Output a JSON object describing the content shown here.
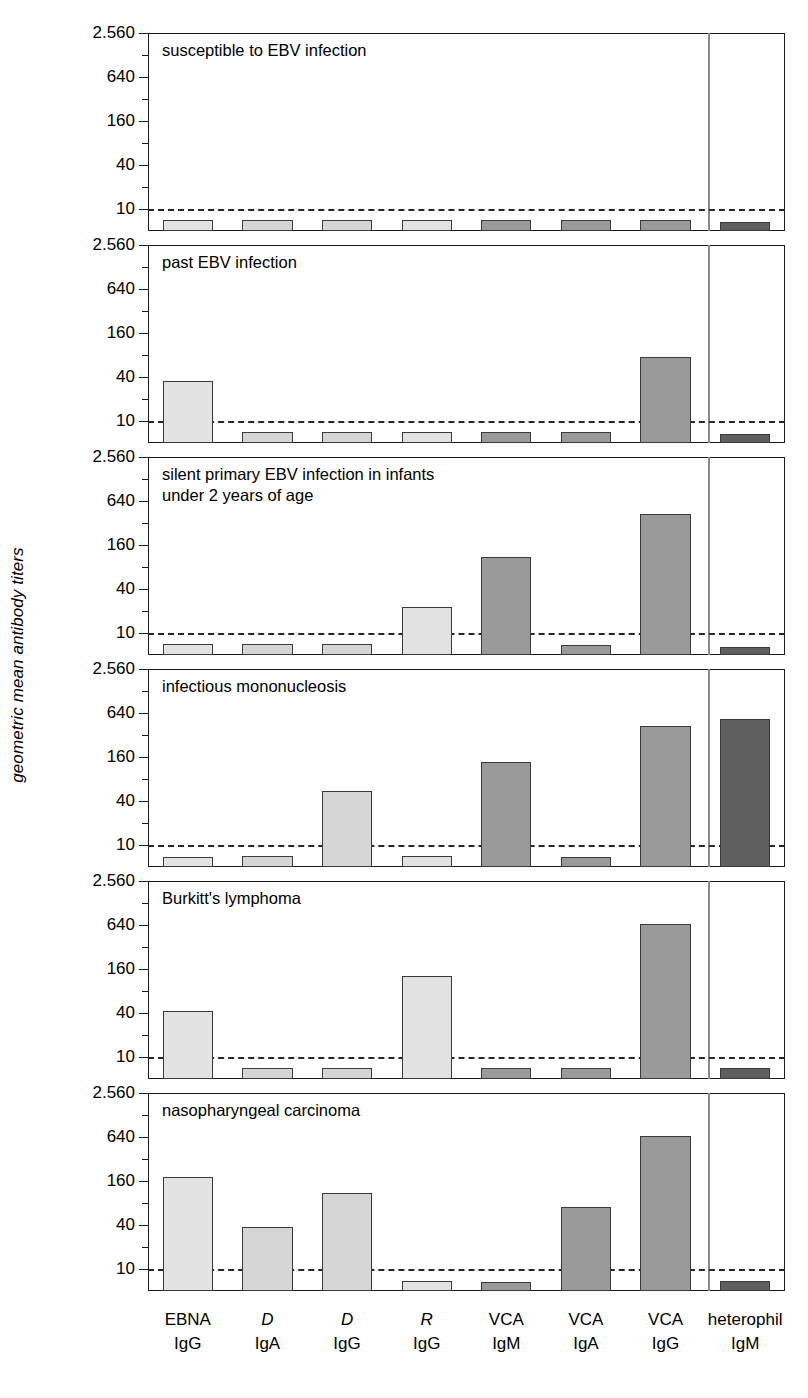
{
  "figure": {
    "ylabel": "geometric mean antibody titers",
    "cutoff_value": 10,
    "divider_after_index": 6
  },
  "axis": {
    "major_ticks": [
      {
        "value": 2560,
        "label": "2.560"
      },
      {
        "value": 640,
        "label": "640"
      },
      {
        "value": 160,
        "label": "160"
      },
      {
        "value": 40,
        "label": "40"
      },
      {
        "value": 10,
        "label": "10"
      }
    ],
    "minor_ticks": [
      1280,
      320,
      80,
      20
    ],
    "ymin": 5,
    "ymax": 2560
  },
  "chart_data": {
    "type": "bar",
    "title": "",
    "subtitle": "",
    "xlabel": "",
    "ylabel": "geometric mean antibody titers",
    "scale": "log",
    "ylim": [
      5,
      2560
    ],
    "grid": false,
    "legend_position": "none",
    "annotations": [
      "dashed line marks cut-off titer of 10"
    ],
    "categories": [
      "EBNA IgG",
      "D IgA",
      "D IgG",
      "R IgG",
      "VCA IgM",
      "VCA IgA",
      "VCA IgG",
      "heterophil IgM"
    ],
    "category_lines": [
      {
        "antigen": "EBNA",
        "italic": false,
        "isotype": "IgG"
      },
      {
        "antigen": "D",
        "italic": true,
        "isotype": "IgA"
      },
      {
        "antigen": "D",
        "italic": true,
        "isotype": "IgG"
      },
      {
        "antigen": "R",
        "italic": true,
        "isotype": "IgG"
      },
      {
        "antigen": "VCA",
        "italic": false,
        "isotype": "IgM"
      },
      {
        "antigen": "VCA",
        "italic": false,
        "isotype": "IgA"
      },
      {
        "antigen": "VCA",
        "italic": false,
        "isotype": "IgG"
      },
      {
        "antigen": "heterophil",
        "italic": false,
        "isotype": "IgM"
      }
    ],
    "series": [
      {
        "name": "susceptible to EBV infection",
        "title_lines": "susceptible to EBV infection",
        "values": [
          7.0,
          7.0,
          7.0,
          7.0,
          7.0,
          7.0,
          7.0,
          6.6
        ]
      },
      {
        "name": "past EBV infection",
        "title_lines": "past EBV infection",
        "values": [
          35,
          7.0,
          7.0,
          7.0,
          7.0,
          7.0,
          75,
          6.6
        ]
      },
      {
        "name": "silent primary EBV infection in infants under 2 years of age",
        "title_lines": "silent primary EBV infection in infants\nunder 2 years of age",
        "values": [
          7.0,
          7.0,
          7.0,
          23,
          110,
          6.8,
          420,
          6.4
        ]
      },
      {
        "name": "infectious mononucleosis",
        "title_lines": "infectious mononucleosis",
        "values": [
          6.8,
          7.0,
          55,
          7.0,
          135,
          6.8,
          420,
          530
        ]
      },
      {
        "name": "Burkitt's lymphoma",
        "title_lines": "Burkitt's lymphoma",
        "values": [
          42,
          7.0,
          7.0,
          130,
          7.0,
          7.0,
          660,
          7.0
        ]
      },
      {
        "name": "nasopharyngeal carcinoma",
        "title_lines": "nasopharyngeal carcinoma",
        "values": [
          180,
          37,
          110,
          6.8,
          6.6,
          70,
          660,
          6.8
        ]
      }
    ]
  },
  "colors": {
    "bar_light": "#e2e2e2",
    "bar_light2": "#d5d5d5",
    "bar_mid": "#9a9a9a",
    "bar_dark": "#5f5f5f",
    "bar_edge": "#3a3a3a",
    "frame": "#1a1a1a",
    "cutoff_line": "#262626",
    "divider": "#8a8a8a",
    "background": "#ffffff"
  },
  "bar_fill_index": [
    0,
    1,
    1,
    0,
    2,
    2,
    2,
    3
  ]
}
